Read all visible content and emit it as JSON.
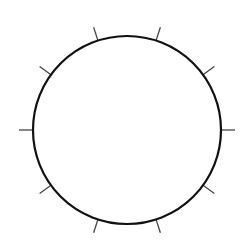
{
  "diagram": {
    "type": "circle-with-tick-marks",
    "circle": {
      "cx": 127,
      "cy": 130,
      "r": 94,
      "stroke": "#111111",
      "stroke_width": 2.2,
      "fill": "#ffffff"
    },
    "ticks": {
      "count": 10,
      "angle_step_deg": 36,
      "start_angle_deg": 0,
      "inner_offset": 0,
      "outer_length": 14,
      "stroke": "#444444",
      "stroke_width": 1.3
    }
  }
}
